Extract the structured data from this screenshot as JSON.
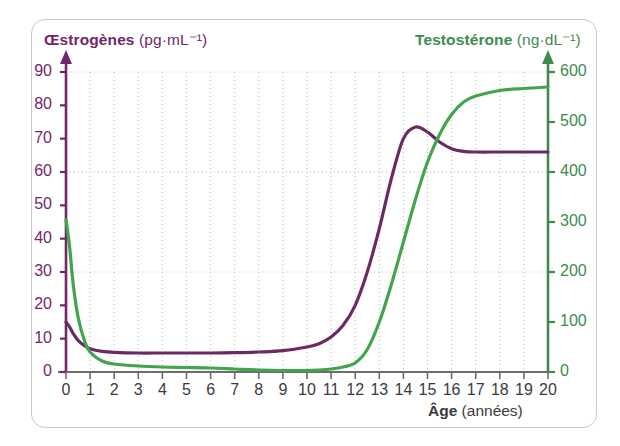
{
  "figure": {
    "background": "#ffffff",
    "frame_color": "#c9c9c9"
  },
  "colors": {
    "estrogen": "#73276a",
    "testosterone": "#3d8c4e",
    "curve_estrogen": "#6b2a62",
    "curve_testosterone": "#42a44c",
    "grid": "#b9b9b9",
    "x_axis": "#6d6d6d",
    "x_tick_text": "#3b3b3b"
  },
  "axes": {
    "left": {
      "name": "Œstrogènes",
      "unit": "(pg·mL⁻¹)",
      "ticks": [
        0,
        10,
        20,
        30,
        40,
        50,
        60,
        70,
        80,
        90
      ],
      "min": 0,
      "max": 90,
      "gridlines_at": [
        30,
        60,
        90
      ]
    },
    "right": {
      "name": "Testostérone",
      "unit": "(ng·dL⁻¹)",
      "ticks": [
        0,
        100,
        200,
        300,
        400,
        500,
        600
      ],
      "min": 0,
      "max": 600
    },
    "bottom": {
      "name": "Âge",
      "unit": "(années)",
      "ticks": [
        0,
        1,
        2,
        3,
        4,
        5,
        6,
        7,
        8,
        9,
        10,
        11,
        12,
        13,
        14,
        15,
        16,
        17,
        18,
        19,
        20
      ],
      "min": 0,
      "max": 20
    }
  },
  "chart_data": {
    "type": "line",
    "title": "",
    "xlabel": "Âge (années)",
    "ylabel": "Œstrogènes (pg·mL⁻¹)",
    "y2label": "Testostérone (ng·dL⁻¹)",
    "xlim": [
      0,
      20
    ],
    "ylim": [
      0,
      90
    ],
    "y2lim": [
      0,
      600
    ],
    "grid": true,
    "legend": "none",
    "x": [
      0,
      0.15,
      0.3,
      0.5,
      0.75,
      1,
      1.5,
      2,
      3,
      4,
      5,
      6,
      7,
      8,
      9,
      10,
      10.5,
      11,
      11.5,
      12,
      12.5,
      13,
      13.5,
      14,
      14.5,
      15,
      15.5,
      16,
      16.5,
      17,
      18,
      19,
      20
    ],
    "series": [
      {
        "name": "Œstrogènes",
        "axis": "left",
        "unit": "pg·mL⁻¹",
        "color": "#6b2a62",
        "values": [
          15,
          13.5,
          11.5,
          9.5,
          8,
          7,
          6.2,
          5.9,
          5.7,
          5.7,
          5.7,
          5.7,
          5.8,
          6,
          6.4,
          7.5,
          8.5,
          10.5,
          14,
          20,
          30,
          43,
          58,
          70,
          73.5,
          72,
          69,
          67,
          66.2,
          66,
          66,
          66,
          66
        ]
      },
      {
        "name": "Testostérone",
        "axis": "right",
        "unit": "ng·dL⁻¹",
        "color": "#42a44c",
        "values": [
          305,
          250,
          175,
          110,
          65,
          40,
          22,
          16,
          12,
          10,
          9,
          8,
          6,
          4,
          3,
          3,
          4,
          6,
          10,
          18,
          45,
          100,
          175,
          260,
          345,
          420,
          475,
          515,
          540,
          552,
          563,
          567,
          570
        ]
      }
    ],
    "annotations": [
      {
        "text": "Œstrogènes peak ≈ 73.5 pg·mL⁻¹ at age 14",
        "series": "Œstrogènes"
      },
      {
        "text": "Testostérone plateau ≈ 570 ng·dL⁻¹ at age 20",
        "series": "Testostérone"
      }
    ]
  }
}
